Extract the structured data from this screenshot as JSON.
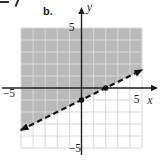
{
  "figure_label": "b.",
  "chart_data": {
    "type": "line",
    "title": "",
    "xlabel": "x",
    "ylabel": "y",
    "xlim": [
      -5,
      5
    ],
    "ylim": [
      -5,
      5
    ],
    "grid": true,
    "legend": "none",
    "tick_labels": {
      "x_left": "−5",
      "x_right": "5",
      "y_top": "5",
      "y_bottom": "−5"
    },
    "boundary_line": {
      "style": "dashed",
      "arrowheads": "both",
      "x": [
        -5,
        5
      ],
      "y": [
        -3.5,
        1.5
      ],
      "slope": 0.5,
      "y_intercept": -1
    },
    "marked_points": [
      {
        "x": 0,
        "y": -1
      },
      {
        "x": 2,
        "y": 0
      }
    ],
    "shaded_region": "above-line",
    "colors": {
      "shade": "#b9b9b9",
      "grid": "#d8d8d8",
      "axis": "#1f1f1f",
      "line": "#101010",
      "point": "#101010"
    }
  }
}
